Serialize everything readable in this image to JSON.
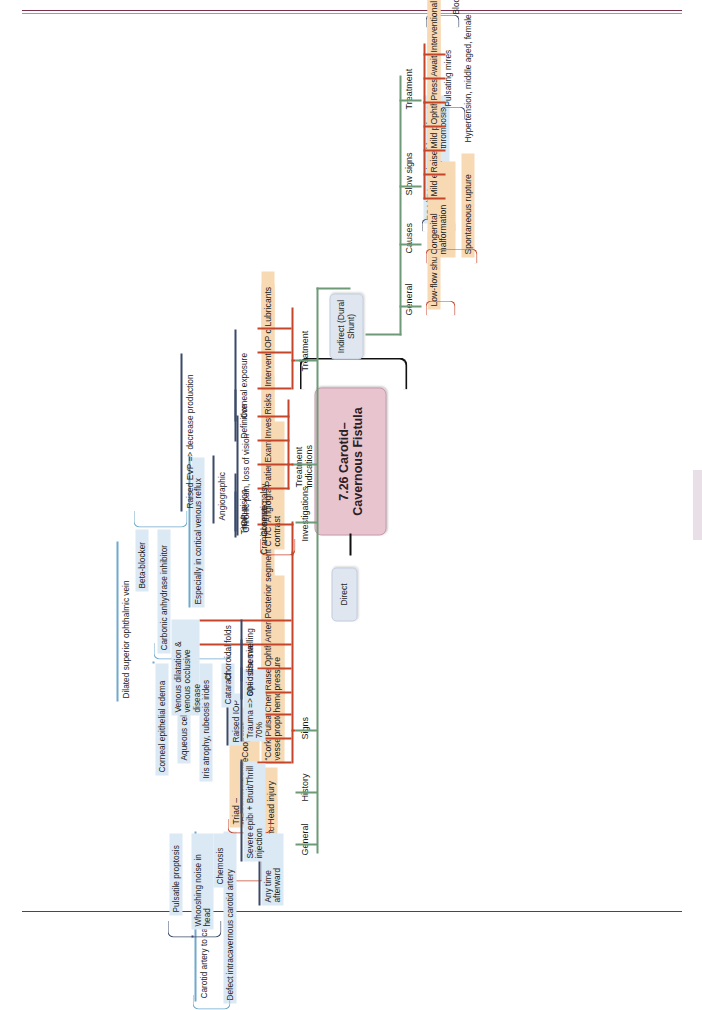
{
  "document": {
    "central_topic": "7.26 Carotid–Cavernous Fistula",
    "accent_colors": {
      "central_fill": "#e8c4cf",
      "category_fill": "#f7d9b4",
      "leaf_fill": "#dbe9f4",
      "pill_fill": "#dfe6f0",
      "trunk_stroke": "#6f9a78",
      "category_stroke": "#c4452a",
      "leaf_stroke_navy": "#3b4a6b",
      "leaf_stroke_blue": "#6fa9cc",
      "root_stroke": "#111111",
      "page_rule": "#7a2f4a"
    }
  },
  "branches": {
    "direct": {
      "label": "Direct",
      "sections": [
        {
          "name": "General",
          "categories": [
            {
              "label": "High-flow shunts",
              "leaves": [
                "Carotid artery to cavernous sinus",
                "Defect intracavernous carotid artery"
              ]
            }
          ]
        },
        {
          "name": "History",
          "categories": [
            {
              "label": "Head injury",
              "leaves": [
                "Any time afterward"
              ]
            },
            {
              "label": "Triad – “PricewaterhouseCoopers”",
              "leaves": [
                "Pulsatile proptosis",
                "Whooshing noise in head",
                "Chemosis"
              ]
            }
          ]
        },
        {
          "name": "Signs",
          "categories": [
            {
              "label": "“Corkscrew vessels”",
              "leaves": [
                "Severe epibulbar injection"
              ]
            },
            {
              "label": "Pulsatile proptosis",
              "leaves": [
                "+ Bruit/Thrill"
              ]
            },
            {
              "label": "Chemosis – hemorrhagic",
              "leaves": []
            },
            {
              "label": "Raised episcleral vein pressure",
              "leaves": [
                "Raised IOP"
              ]
            },
            {
              "label": "Ophthalmoplegia",
              "leaves": [
                "Trauma => 60–70%"
              ]
            },
            {
              "label": "Anterior segment",
              "leaves": [
                "Ischemia",
                "Corneal epithelial edema",
                "Aqueous cells & flare",
                "Iris atrophy, rubeosis irides",
                "Cataract"
              ]
            },
            {
              "label": "Posterior segment",
              "leaves": [
                "Optic disc swelling",
                "Choroidal folds",
                "Venous dilatation & venous occlusive disease"
              ]
            }
          ]
        },
        {
          "name": "Investigations",
          "categories": [
            {
              "label": "CT/CTA or MRI/MRA with contrast",
              "leaves": [
                "Dilated superior ophthalmic vein"
              ]
            },
            {
              "label": "Angiography",
              "leaves": []
            }
          ]
        },
        {
          "name": "Treatment indications",
          "categories": [
            {
              "label": "Patient",
              "leaves": [
                "Tinnitus",
                "Cosmetic"
              ]
            },
            {
              "label": "Examination",
              "leaves": [
                "IOP, vision",
                "Cranial nerve palsy"
              ]
            },
            {
              "label": "Investigation",
              "leaves": [
                "Angiographic",
                "Especially in cortical venous reflux"
              ]
            },
            {
              "label": "Risks",
              "leaves": [
                "Chronic pain, loss of vision"
              ]
            }
          ]
        },
        {
          "name": "Treatment",
          "categories": [
            {
              "label": "Interventional radiology",
              "leaves": [
                "Definitive"
              ]
            },
            {
              "label": "IOP control",
              "leaves": [
                "Raised EVP => decrease production",
                "Beta-blocker",
                "Carbonic anhydrase inhibitor"
              ]
            },
            {
              "label": "Lubricants",
              "leaves": [
                "Corneal exposure"
              ]
            }
          ]
        }
      ]
    },
    "indirect": {
      "label": "Indirect (Dural Shunt)",
      "sections": [
        {
          "name": "General",
          "categories": [
            {
              "label": "Low-flow shunts",
              "leaves": [
                "ECA/ICA meningeal branches to cavernous sinus"
              ]
            }
          ]
        },
        {
          "name": "Causes",
          "categories": [
            {
              "label": "Congenital malformation",
              "leaves": [
                "Secondary to intracranial vascular thrombosis"
              ]
            },
            {
              "label": "Spontaneous rupture",
              "leaves": [
                "Hypertension, middle aged, female"
              ]
            }
          ]
        },
        {
          "name": "Slow signs",
          "categories": [
            {
              "label": "Mild epibulbar injection",
              "leaves": []
            },
            {
              "label": "Raised IOP",
              "leaves": [
                "Pulsating mires"
              ]
            },
            {
              "label": "Mild proptosis",
              "leaves": []
            },
            {
              "label": "Ophthalmoplegia",
              "leaves": []
            }
          ]
        },
        {
          "name": "Treatment",
          "categories": [
            {
              "label": "Pressure control",
              "leaves": [
                "IOP",
                "Blood pressure"
              ]
            },
            {
              "label": "Await spontaneous closure",
              "leaves": []
            },
            {
              "label": "Interventional radiology",
              "leaves": []
            }
          ]
        }
      ]
    }
  }
}
